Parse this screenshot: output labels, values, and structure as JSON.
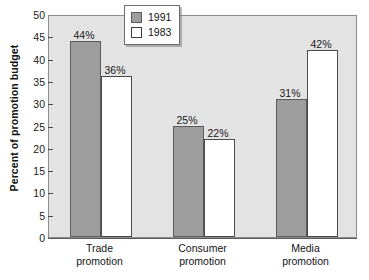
{
  "chart_data": {
    "type": "bar",
    "title": "",
    "xlabel": "",
    "ylabel": "Percent of promotion budget",
    "ylim": [
      0,
      50
    ],
    "yticks": [
      0,
      5,
      10,
      15,
      20,
      25,
      30,
      35,
      40,
      45,
      50
    ],
    "ytick_labels": [
      "0",
      "5",
      "10",
      "15",
      "20",
      "25",
      "30",
      "35",
      "40",
      "45",
      "50"
    ],
    "grid": false,
    "legend_position": "top-center",
    "categories": [
      "Trade promotion",
      "Consumer promotion",
      "Media promotion"
    ],
    "category_lines": [
      [
        "Trade",
        "promotion"
      ],
      [
        "Consumer",
        "promotion"
      ],
      [
        "Media",
        "promotion"
      ]
    ],
    "series": [
      {
        "name": "1991",
        "color": "#9d9d9d",
        "values": [
          44,
          25,
          31
        ],
        "data_labels": [
          "44%",
          "25%",
          "31%"
        ]
      },
      {
        "name": "1983",
        "color": "#ffffff",
        "values": [
          36,
          22,
          42
        ],
        "data_labels": [
          "36%",
          "22%",
          "42%"
        ]
      }
    ]
  },
  "legend": {
    "entries": [
      {
        "label": "1991",
        "swatch": "gray"
      },
      {
        "label": "1983",
        "swatch": "white"
      }
    ]
  },
  "colors": {
    "plot_background": "#e3e3e3",
    "series_1991": "#9d9d9d",
    "series_1983": "#ffffff",
    "axis": "#5a5a5a",
    "text": "#141414"
  }
}
